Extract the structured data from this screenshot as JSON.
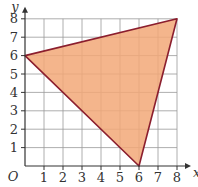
{
  "diagram": {
    "type": "coordinate-grid-triangle",
    "axes": {
      "x_label": "x",
      "y_label": "y",
      "origin_label": "O",
      "x_ticks": [
        "1",
        "2",
        "3",
        "4",
        "5",
        "6",
        "7",
        "8"
      ],
      "y_ticks": [
        "1",
        "2",
        "3",
        "4",
        "5",
        "6",
        "7",
        "8"
      ],
      "x_range": [
        0,
        8
      ],
      "y_range": [
        0,
        8
      ]
    },
    "triangle": {
      "vertices": [
        [
          0,
          6
        ],
        [
          8,
          8
        ],
        [
          6,
          0
        ]
      ],
      "fill_color": "#F2A878",
      "stroke_color": "#8B1E2E"
    },
    "grid_color": "#999999"
  }
}
